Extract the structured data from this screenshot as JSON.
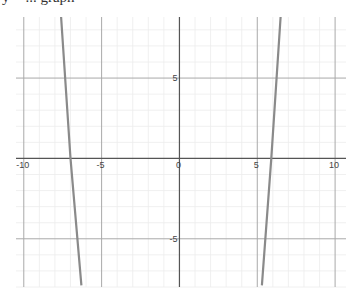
{
  "caption": "y = ... graph",
  "chart_data": {
    "type": "line",
    "title": "",
    "xlabel": "",
    "ylabel": "",
    "xlim": [
      -10.5,
      10.7
    ],
    "ylim": [
      -8.0,
      8.8
    ],
    "grid": true,
    "minor_step": 1,
    "major_step": 5,
    "x_ticks": [
      -10,
      -5,
      0,
      5,
      10
    ],
    "x_tick_labels": [
      "-10",
      "-5",
      "0",
      "5",
      "10"
    ],
    "y_ticks": [
      5,
      -5
    ],
    "y_tick_labels": [
      "5",
      "-5"
    ],
    "series": [
      {
        "name": "left-branch",
        "color": "#8a8a8a",
        "points": [
          [
            -7.6,
            8.8
          ],
          [
            -7.0,
            0
          ],
          [
            -6.3,
            -7.9
          ]
        ]
      },
      {
        "name": "right-branch",
        "color": "#8a8a8a",
        "points": [
          [
            6.5,
            8.8
          ],
          [
            5.9,
            0
          ],
          [
            5.3,
            -7.9
          ]
        ]
      }
    ],
    "colors": {
      "minor_grid": "#ececec",
      "major_grid": "#a9a9a9",
      "axis": "#555555"
    }
  }
}
